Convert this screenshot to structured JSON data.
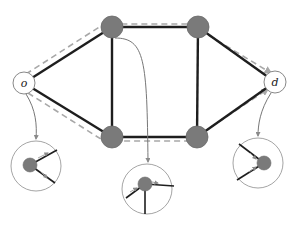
{
  "diagram": {
    "type": "network-flow",
    "colors": {
      "edge": "#1e1e1e",
      "dashed_path": "#a8a8a8",
      "node_fill": "#7a7a7a",
      "node_stroke": "#6a6a6a",
      "terminal_fill": "#ffffff",
      "terminal_stroke": "#888888",
      "callout": "#777777",
      "inset_stroke": "#9a9a9a"
    },
    "nodes": [
      {
        "id": "o",
        "label": "o",
        "x": 24,
        "y": 83,
        "r": 11,
        "kind": "terminal"
      },
      {
        "id": "d",
        "label": "d",
        "x": 275,
        "y": 82,
        "r": 11,
        "kind": "terminal"
      },
      {
        "id": "a",
        "label": "",
        "x": 112,
        "y": 27,
        "r": 11,
        "kind": "internal"
      },
      {
        "id": "b",
        "label": "",
        "x": 198,
        "y": 27,
        "r": 11,
        "kind": "internal"
      },
      {
        "id": "c",
        "label": "",
        "x": 112,
        "y": 137,
        "r": 11,
        "kind": "internal"
      },
      {
        "id": "e",
        "label": "",
        "x": 197,
        "y": 137,
        "r": 11,
        "kind": "internal"
      }
    ],
    "edges": [
      {
        "from": "o",
        "to": "a"
      },
      {
        "from": "o",
        "to": "c"
      },
      {
        "from": "a",
        "to": "b"
      },
      {
        "from": "a",
        "to": "c"
      },
      {
        "from": "b",
        "to": "e"
      },
      {
        "from": "c",
        "to": "e"
      },
      {
        "from": "b",
        "to": "d"
      },
      {
        "from": "e",
        "to": "d"
      }
    ],
    "dashed_paths": [
      {
        "name": "upper-route",
        "points": [
          [
            26,
            74
          ],
          [
            104,
            24
          ],
          [
            190,
            24
          ],
          [
            271,
            73
          ]
        ]
      },
      {
        "name": "lower-route",
        "points": [
          [
            28,
            93
          ],
          [
            104,
            141
          ],
          [
            190,
            141
          ],
          [
            268,
            89
          ]
        ]
      }
    ],
    "insets": [
      {
        "name": "origin-inset",
        "of": "o",
        "x": 36,
        "y": 166,
        "r": 25,
        "center_node": {
          "x": 30,
          "y": 165,
          "r": 7
        },
        "spokes": [
          [
            57,
            150
          ],
          [
            55,
            183
          ]
        ],
        "flow_arrows": [
          {
            "from": [
              38,
              158
            ],
            "to": [
              48,
              153
            ],
            "dir": "in"
          },
          {
            "from": [
              40,
              171
            ],
            "to": [
              47,
              178
            ],
            "dir": "out"
          }
        ]
      },
      {
        "name": "junction-inset",
        "of": "a",
        "x": 147,
        "y": 189,
        "r": 25,
        "center_node": {
          "x": 145,
          "y": 184,
          "r": 7
        },
        "spokes": [
          [
            174,
            186
          ],
          [
            126,
            198
          ],
          [
            145,
            214
          ]
        ],
        "flow_arrows": [
          {
            "from": [
              130,
              192
            ],
            "to": [
              137,
              188
            ],
            "dir": "in"
          },
          {
            "from": [
              152,
              182
            ],
            "to": [
              158,
              183
            ],
            "dir": "out"
          }
        ]
      },
      {
        "name": "destination-inset",
        "of": "d",
        "x": 258,
        "y": 163,
        "r": 25,
        "center_node": {
          "x": 264,
          "y": 163,
          "r": 7
        },
        "spokes": [
          [
            239,
            144
          ],
          [
            237,
            180
          ]
        ],
        "flow_arrows": [
          {
            "from": [
              250,
              153
            ],
            "to": [
              256,
              159
            ],
            "dir": "in"
          },
          {
            "from": [
              249,
              172
            ],
            "to": [
              256,
              167
            ],
            "dir": "in"
          }
        ]
      }
    ],
    "callouts": [
      {
        "name": "o-to-inset",
        "d": "M 26 94 C 36 110, 37 125, 36 139"
      },
      {
        "name": "a-to-inset",
        "d": "M 115 38 C 145 38, 147 60, 148 162"
      },
      {
        "name": "d-to-inset",
        "d": "M 271 93 C 260 110, 258 125, 258 136"
      }
    ]
  }
}
